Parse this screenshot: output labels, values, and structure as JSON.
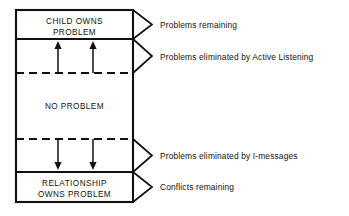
{
  "figure": {
    "background_color": "#ffffff",
    "line_color": "#111111",
    "text_color": "#121212"
  },
  "bands": [
    {
      "id": "child-owns-problem",
      "lines": [
        "CHILD OWNS",
        "PROBLEM"
      ],
      "top": 10,
      "bottom": 39,
      "divider_below": "solid"
    },
    {
      "id": "problems-eliminated-active-listening-band",
      "lines": [],
      "top": 39,
      "bottom": 73,
      "divider_below": "dashed",
      "arrows": {
        "direction": "up",
        "count": 2
      }
    },
    {
      "id": "no-problem",
      "lines": [
        "NO PROBLEM"
      ],
      "top": 73,
      "bottom": 139,
      "divider_below": "dashed"
    },
    {
      "id": "problems-eliminated-i-messages-band",
      "lines": [],
      "top": 139,
      "bottom": 172,
      "divider_below": "solid",
      "arrows": {
        "direction": "down",
        "count": 2
      }
    },
    {
      "id": "relationship-owns-problem",
      "lines": [
        "RELATIONSHIP",
        "OWNS PROBLEM"
      ],
      "top": 172,
      "bottom": 202,
      "divider_below": "none"
    }
  ],
  "callouts": [
    {
      "id": "problems-remaining",
      "label": "Problems remaining",
      "pointer_top": 10,
      "pointer_bottom": 39,
      "text_y": 28
    },
    {
      "id": "problems-eliminated-active-listening",
      "label": "Problems eliminated by Active Listening",
      "pointer_top": 39,
      "pointer_bottom": 73,
      "text_y": 61
    },
    {
      "id": "problems-eliminated-i-messages",
      "label": "Problems  eliminated by I-messages",
      "pointer_top": 139,
      "pointer_bottom": 172,
      "text_y": 159
    },
    {
      "id": "conflicts-remaining",
      "label": "Conflicts remaining",
      "pointer_top": 172,
      "pointer_bottom": 202,
      "text_y": 190
    }
  ],
  "geometry": {
    "box_left": 16,
    "box_right": 133,
    "box_top": 10,
    "box_bottom": 202,
    "pointer_tip_x": 152,
    "callout_text_x": 160,
    "arrow_x_positions": [
      58,
      93
    ]
  }
}
